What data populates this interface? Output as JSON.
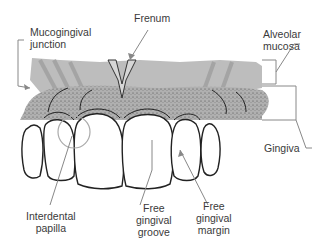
{
  "diagram": {
    "colors": {
      "alveolar_mucosa": "#b8b8b8",
      "gingiva": "#a9a9a9",
      "stipple": "#555555",
      "tooth_fill": "#ffffff",
      "tooth_outline": "#222222",
      "leader_line": "#888888",
      "label_text": "#3a3a3a"
    },
    "labels": {
      "mucogingival_junction": "Mucogingival\njunction",
      "frenum": "Frenum",
      "alveolar_mucosa": "Alveolar\nmucosa",
      "gingiva": "Gingiva",
      "interdental_papilla": "Interdental\npapilla",
      "free_gingival_groove": "Free\ngingival\ngroove",
      "free_gingival_margin": "Free\ngingival\nmargin"
    }
  }
}
